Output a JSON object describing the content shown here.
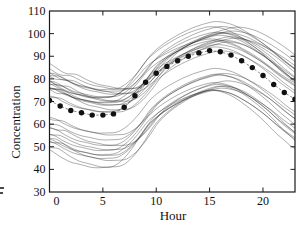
{
  "chart_data": {
    "type": "line",
    "title": "",
    "xlabel": "Hour",
    "ylabel": "Concentration",
    "xlim": [
      0,
      23
    ],
    "ylim": [
      30,
      110
    ],
    "x_ticks": [
      0,
      5,
      10,
      15,
      20
    ],
    "y_ticks": [
      30,
      40,
      50,
      60,
      70,
      80,
      90,
      100,
      110
    ],
    "grid": false,
    "frame": "box-with-inward-mirrored-ticks",
    "x": [
      0,
      1,
      2,
      3,
      4,
      5,
      6,
      7,
      8,
      9,
      10,
      11,
      12,
      13,
      14,
      15,
      16,
      17,
      18,
      19,
      20,
      21,
      22,
      23
    ],
    "mean_series": {
      "name": "mean-concentration",
      "marker": "filled-circle",
      "marker_color": "#111111",
      "line_style": "dashed",
      "values": [
        70.5,
        68,
        66,
        65,
        64,
        64,
        64.5,
        67.5,
        72.5,
        78.5,
        82.5,
        85.5,
        88,
        90,
        91.5,
        92.5,
        92,
        90.5,
        88,
        85,
        81.5,
        77.5,
        74,
        71
      ]
    },
    "ensemble_lines": {
      "name": "individual-concentration-profiles",
      "color": "#1a1a1a",
      "count": 31,
      "note": "thin overlapping diurnal profiles; value(h) = center + amp * shape(h - phase), shape periodic over 24 h, estimated from pixels",
      "shape": [
        -7.4,
        -9.9,
        -11.9,
        -12.9,
        -13.9,
        -13.9,
        -13.4,
        -10.4,
        -5.4,
        0.6,
        4.6,
        7.6,
        10.1,
        12.1,
        13.6,
        14.6,
        14.1,
        12.6,
        10.1,
        7.1,
        3.6,
        -0.4,
        -3.9,
        -6.9
      ],
      "params": [
        [
          90,
          1.05,
          0.5
        ],
        [
          89,
          0.95,
          2.5
        ],
        [
          88.5,
          1.0,
          1.0
        ],
        [
          88,
          0.9,
          2.0
        ],
        [
          87,
          1.1,
          0.0
        ],
        [
          86.5,
          0.95,
          1.5
        ],
        [
          86,
          1.0,
          0.5
        ],
        [
          85.5,
          0.85,
          2.2
        ],
        [
          85,
          1.05,
          1.0
        ],
        [
          84.5,
          0.9,
          0.0
        ],
        [
          84,
          1.0,
          1.8
        ],
        [
          83.5,
          1.08,
          0.8
        ],
        [
          83,
          0.95,
          0.2
        ],
        [
          82.5,
          1.0,
          1.2
        ],
        [
          82,
          0.9,
          0.6
        ],
        [
          81,
          1.05,
          1.6
        ],
        [
          79.5,
          1.0,
          0.4
        ],
        [
          78.5,
          0.95,
          1.0
        ],
        [
          70,
          1.0,
          0.4
        ],
        [
          68.5,
          0.95,
          1.2
        ],
        [
          67,
          1.0,
          0.8
        ],
        [
          66,
          1.1,
          0.5
        ],
        [
          64.5,
          1.0,
          1.5
        ],
        [
          63,
          1.05,
          0.3
        ],
        [
          62,
          0.95,
          1.0
        ],
        [
          61.5,
          1.1,
          0.6
        ],
        [
          60.5,
          1.0,
          0.2
        ],
        [
          60,
          1.15,
          1.2
        ],
        [
          59.5,
          1.05,
          0.4
        ],
        [
          58.5,
          1.25,
          0.8
        ],
        [
          57.5,
          1.2,
          0.0
        ]
      ]
    },
    "axis_color": "#1a1a1a",
    "text_color": "#111111"
  },
  "stray_fragment": ""
}
